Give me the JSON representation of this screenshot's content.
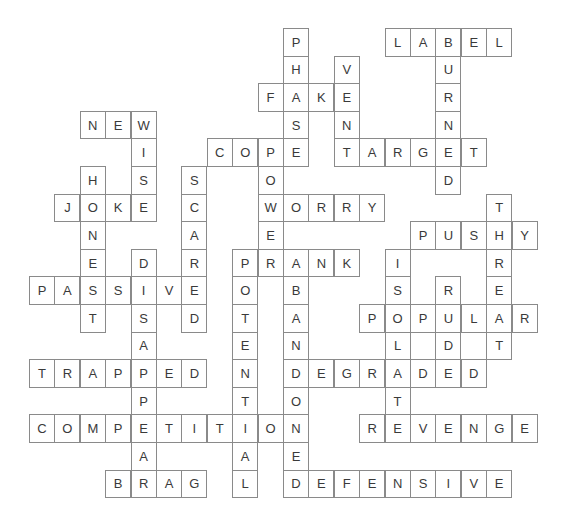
{
  "puzzle": {
    "type": "crossword-solution",
    "grid": {
      "origin_x": 3.6,
      "origin_y": 28,
      "cell_w": 25.4,
      "cell_h": 27.6
    },
    "colors": {
      "border": "#8a8a8a",
      "text": "#3a3a3a",
      "background": "#ffffff"
    },
    "across": [
      {
        "word": "LABEL",
        "row": 0,
        "col": 15
      },
      {
        "word": "FAKE",
        "row": 2,
        "col": 10
      },
      {
        "word": "NEW",
        "row": 3,
        "col": 3
      },
      {
        "word": "COPE",
        "row": 4,
        "col": 8
      },
      {
        "word": "TARGET",
        "row": 4,
        "col": 13
      },
      {
        "word": "JOKE",
        "row": 6,
        "col": 2
      },
      {
        "word": "WORRY",
        "row": 6,
        "col": 10
      },
      {
        "word": "PUSHY",
        "row": 7,
        "col": 16
      },
      {
        "word": "PRANK",
        "row": 8,
        "col": 9
      },
      {
        "word": "PASSIVE",
        "row": 9,
        "col": 1
      },
      {
        "word": "POPULAR",
        "row": 10,
        "col": 14
      },
      {
        "word": "TRAPPED",
        "row": 12,
        "col": 1
      },
      {
        "word": "DEGRADED",
        "row": 12,
        "col": 11
      },
      {
        "word": "COMPETITION",
        "row": 14,
        "col": 1
      },
      {
        "word": "REVENGE",
        "row": 14,
        "col": 14
      },
      {
        "word": "BRAG",
        "row": 16,
        "col": 4
      },
      {
        "word": "DEFENSIVE",
        "row": 16,
        "col": 11
      }
    ],
    "down": [
      {
        "word": "PHASE",
        "row": 0,
        "col": 11
      },
      {
        "word": "BURNED",
        "row": 0,
        "col": 17
      },
      {
        "word": "VENT",
        "row": 1,
        "col": 13
      },
      {
        "word": "WISE",
        "row": 3,
        "col": 5
      },
      {
        "word": "POWER",
        "row": 4,
        "col": 10
      },
      {
        "word": "HONEST",
        "row": 5,
        "col": 3
      },
      {
        "word": "SCARED",
        "row": 5,
        "col": 7
      },
      {
        "word": "THREAT",
        "row": 6,
        "col": 19
      },
      {
        "word": "DISAPPEAR",
        "row": 8,
        "col": 5
      },
      {
        "word": "POTENTIAL",
        "row": 8,
        "col": 9
      },
      {
        "word": "ABANDONED",
        "row": 8,
        "col": 11
      },
      {
        "word": "ISOLATE",
        "row": 8,
        "col": 15
      },
      {
        "word": "RUDE",
        "row": 9,
        "col": 17
      }
    ]
  }
}
